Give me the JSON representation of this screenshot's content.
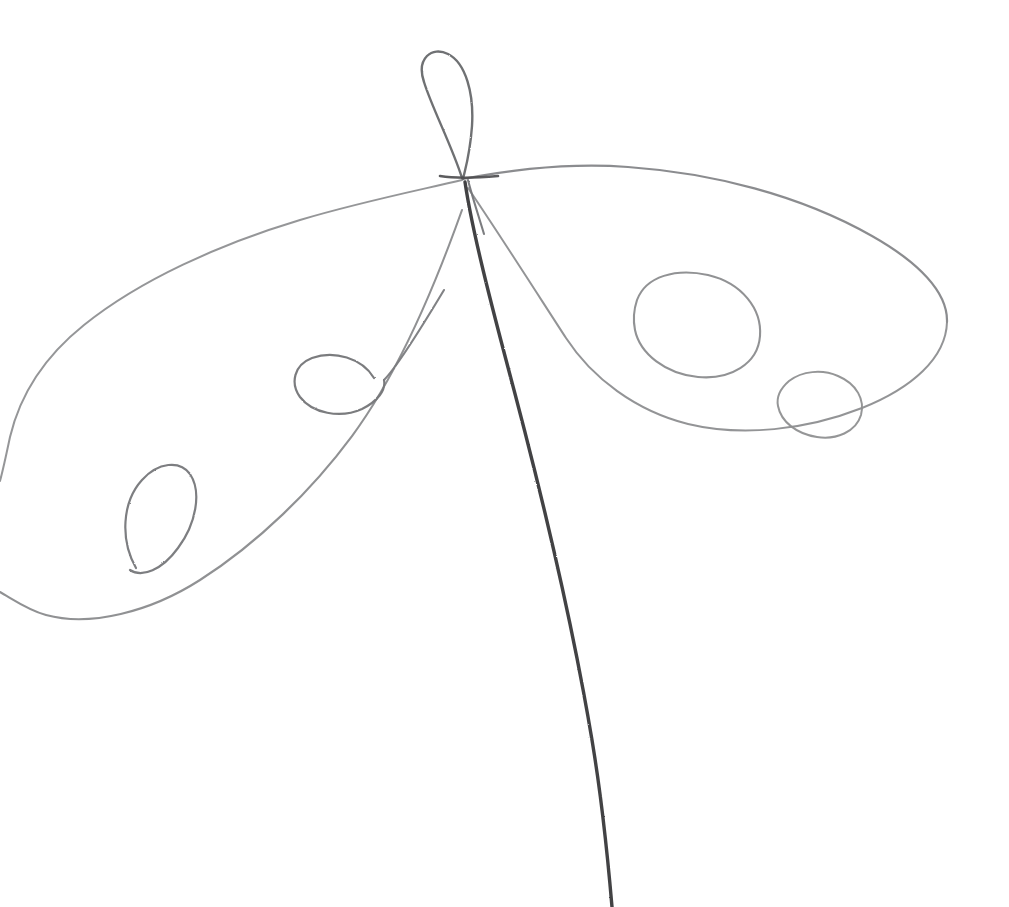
{
  "artwork": {
    "title": "Continuous-line pencil sketch",
    "subject": "abstract winged loop figure (dragonfly-like)",
    "medium": "graphite pencil on white paper",
    "style": "single continuous contour line, unshaded, open composition",
    "canvas": {
      "width": 1009,
      "height": 907,
      "background_color": "#ffffff"
    },
    "palette": {
      "paper": "#ffffff",
      "stroke_dark": "#3c3c3c",
      "stroke_mid": "#6a6a6c",
      "stroke_light": "#8f9092",
      "stroke_faint": "#b3b4b6"
    },
    "stroke_style": {
      "base_width_px": 2.1,
      "tail_width_px": 3.4,
      "texture": "slightly granular graphite edge"
    },
    "features": [
      {
        "id": "top-loop",
        "label": "upper vertical loop",
        "bbox": [
          413,
          48,
          60,
          135
        ],
        "apex": [
          440,
          52
        ],
        "tone": "stroke_mid"
      },
      {
        "id": "central-junction",
        "label": "central crossing point",
        "point": [
          462,
          179
        ],
        "tone": "stroke_dark"
      },
      {
        "id": "right-wing",
        "label": "large right wing lobe",
        "bbox": [
          462,
          162,
          488,
          250
        ],
        "apex": [
          622,
          167
        ],
        "right_turn": [
          947,
          320
        ],
        "tone": "stroke_light"
      },
      {
        "id": "left-wing",
        "label": "large left wing lobe",
        "bbox": [
          0,
          180,
          470,
          440
        ],
        "tone": "stroke_light"
      },
      {
        "id": "circle-large-right",
        "label": "large circle on right wing",
        "center": [
          697,
          325
        ],
        "radius_x": 64,
        "radius_y": 51,
        "tone": "stroke_light"
      },
      {
        "id": "circle-small-right",
        "label": "small circle on right wing",
        "center": [
          820,
          404
        ],
        "radius_x": 43,
        "radius_y": 33,
        "tone": "stroke_light"
      },
      {
        "id": "loop-small-left",
        "label": "small loop on left wing",
        "center": [
          338,
          385
        ],
        "radius_x": 40,
        "radius_y": 30,
        "tone": "stroke_mid"
      },
      {
        "id": "loop-narrow-left",
        "label": "narrow tilted loop on left wing",
        "center": [
          162,
          518
        ],
        "radius_x": 32,
        "radius_y": 55,
        "tone": "stroke_mid"
      },
      {
        "id": "tail",
        "label": "long descending tail stroke",
        "start": [
          466,
          185
        ],
        "end": [
          612,
          907
        ],
        "tone": "stroke_dark"
      },
      {
        "id": "edge-exit-upper-left",
        "label": "line exits left edge (upper)",
        "point": [
          0,
          480
        ],
        "tone": "stroke_faint"
      },
      {
        "id": "edge-exit-lower-left",
        "label": "line exits left edge (lower)",
        "point": [
          0,
          592
        ],
        "tone": "stroke_faint"
      },
      {
        "id": "edge-exit-bottom",
        "label": "tail exits bottom edge",
        "point": [
          612,
          907
        ],
        "tone": "stroke_dark"
      }
    ],
    "paths": {
      "right_wing_top": "M463,179 C520,168 575,163 628,167 C712,173 800,195 872,236 C918,262 948,292 947,322",
      "right_wing_bottom": "M947,322 C946,358 912,388 862,408 C806,430 742,437 688,424 C636,411 592,378 566,338 C540,298 498,232 468,188",
      "circle_large": "M637,300 C646,276 676,268 708,275 C742,283 762,309 760,336 C758,364 730,380 698,377 C666,374 640,354 635,330 C633,320 634,309 637,300 Z",
      "circle_small": "M789,381 C802,371 822,369 838,376 C857,384 865,400 861,415 C856,432 836,440 817,437 C797,434 781,422 778,406 C776,396 781,388 789,381 Z",
      "left_wing_top": "M462,180 C420,190 360,202 300,220 C220,244 140,280 84,325 C44,357 20,395 10,437 C6,456 3,470 0,481",
      "left_wing_bottom": "M0,592 C14,600 28,610 46,615 C90,627 150,612 200,580 C258,543 312,490 352,436 C392,382 430,300 462,210",
      "loop_small_left": "M374,378 C362,358 334,350 312,358 C294,365 290,383 300,397 C312,413 340,419 362,409 C378,401 386,390 384,380",
      "loop_small_left_tail": "M384,380 C396,368 420,330 444,290",
      "loop_narrow_left": "M136,568 C120,540 122,502 142,480 C158,462 180,460 190,474 C202,492 196,524 178,548 C162,570 142,578 130,570",
      "top_loop": "M462,178 C452,146 432,108 424,82 C416,58 432,46 448,54 C466,63 474,94 472,126 C470,154 466,166 463,179",
      "top_loop_inner": "M468,180 C472,196 478,214 484,234",
      "tail_main": "M465,182 C472,230 490,300 514,390 C542,496 572,620 592,740 C602,800 608,860 612,907",
      "junction_cross": "M440,176 C452,178 476,178 498,176"
    }
  }
}
